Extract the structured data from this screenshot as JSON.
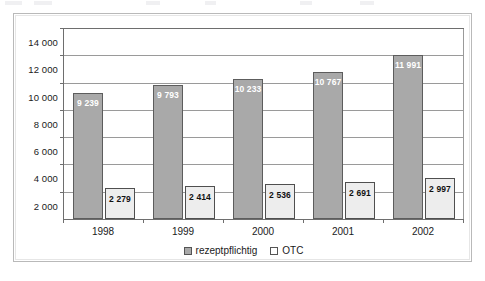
{
  "chart_data": {
    "type": "bar",
    "title": "",
    "subtitle": "",
    "xlabel": "",
    "ylabel": "",
    "categories": [
      "1998",
      "1999",
      "2000",
      "2001",
      "2002"
    ],
    "series": [
      {
        "name": "rezeptpflichtig",
        "color": "#a9a9a9",
        "values": [
          9239,
          9793,
          10233,
          10767,
          11991
        ],
        "labels": [
          "9 239",
          "9 793",
          "10 233",
          "10 767",
          "11 991"
        ]
      },
      {
        "name": "OTC",
        "color": "#ededed",
        "values": [
          2279,
          2414,
          2536,
          2691,
          2997
        ],
        "labels": [
          "2 279",
          "2 414",
          "2 536",
          "2 691",
          "2 997"
        ]
      }
    ],
    "ylim": [
      0,
      14000
    ],
    "ytick_values": [
      2000,
      4000,
      6000,
      8000,
      10000,
      12000,
      14000
    ],
    "ytick_labels": [
      "2 000",
      "4 000",
      "6 000",
      "8 000",
      "10 000",
      "12 000",
      "14 000"
    ],
    "grid": true,
    "legend_position": "bottom-center",
    "legend": [
      "rezeptpflichtig",
      "OTC"
    ]
  },
  "legend": {
    "items": [
      {
        "label": "rezeptpflichtig",
        "swatch": "gray-square-icon"
      },
      {
        "label": "OTC",
        "swatch": "white-square-icon"
      }
    ]
  }
}
